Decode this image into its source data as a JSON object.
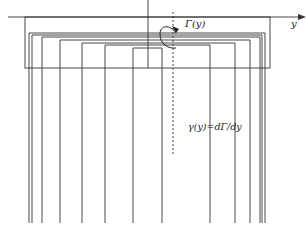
{
  "labels": {
    "axis_y": "y",
    "circulation": "Γ(y)",
    "vortex_density": "γ(y)=dΓ/dy"
  },
  "colors": {
    "line": "#333333",
    "background": "#ffffff"
  },
  "geometry": {
    "axis": {
      "x1": 8,
      "x2": 300,
      "y": 17
    },
    "wing": {
      "x": 25,
      "y": 17,
      "w": 245,
      "h": 51
    },
    "center_line_x": 148,
    "dashed_line_x": 173,
    "dashed_y": [
      12,
      155
    ],
    "trailing_bottom": 223,
    "vortices": [
      {
        "left": 29,
        "right": 265,
        "bound_y": 33
      },
      {
        "left": 32,
        "right": 262,
        "bound_y": 35
      },
      {
        "left": 42,
        "right": 260,
        "bound_y": 37
      },
      {
        "left": 60,
        "right": 250,
        "bound_y": 40
      },
      {
        "left": 82,
        "right": 235,
        "bound_y": 43
      },
      {
        "left": 105,
        "right": 210,
        "bound_y": 45
      },
      {
        "left": 133,
        "right": 162,
        "bound_y": 48
      }
    ]
  }
}
